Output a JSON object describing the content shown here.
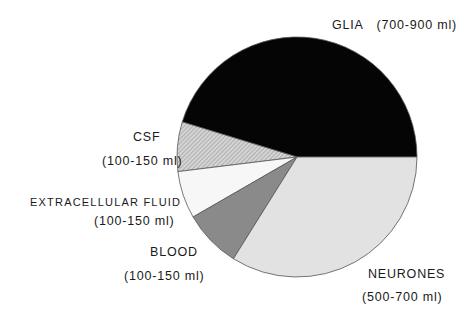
{
  "chart_data": {
    "type": "pie",
    "title": "",
    "center": [
      297,
      157
    ],
    "radius": 120,
    "start_angle_deg": 0,
    "direction": "counterclockwise",
    "slices": [
      {
        "name": "GLIA",
        "range": "(700-900 ml)",
        "degrees": 163,
        "percent": 45,
        "fill": "#050505",
        "pattern": "solid"
      },
      {
        "name": "CSF",
        "range": "(100-150 ml)",
        "degrees": 24,
        "percent": 7,
        "fill": "#c8c8c8",
        "pattern": "hatch"
      },
      {
        "name": "EXTRACELLULAR FLUID",
        "range": "(100-150 ml)",
        "degrees": 23,
        "percent": 6,
        "fill": "#f7f7f7",
        "pattern": "solid"
      },
      {
        "name": "BLOOD",
        "range": "(100-150 ml)",
        "degrees": 28,
        "percent": 8,
        "fill": "#8a8a8a",
        "pattern": "solid"
      },
      {
        "name": "NEURONES",
        "range": "(500-700 ml)",
        "degrees": 122,
        "percent": 34,
        "fill": "#e2e2e2",
        "pattern": "solid"
      }
    ]
  },
  "labels": {
    "glia": "GLIA",
    "glia_range": "(700-900 ml)",
    "csf": "CSF",
    "csf_range": "(100-150 ml)",
    "ecf": "EXTRACELLULAR FLUID",
    "ecf_range": "(100-150 ml)",
    "blood": "BLOOD",
    "blood_range": "(100-150 ml)",
    "neurones": "NEURONES",
    "neurones_range": "(500-700 ml)"
  }
}
